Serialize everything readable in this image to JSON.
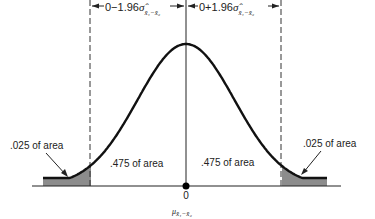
{
  "diagram": {
    "type": "normal-distribution-two-tailed",
    "top_labels": {
      "left": {
        "prefix": "0−1.96",
        "sigma": "σ̂",
        "subscript": "x̄₁−x̄₂"
      },
      "right": {
        "prefix": "0+1.96",
        "sigma": "σ̂",
        "subscript": "x̄₁−x̄₂"
      }
    },
    "regions": [
      {
        "name": "left-tail",
        "label": ".025 of area",
        "shaded": true,
        "area": 0.025
      },
      {
        "name": "left-center",
        "label": ".475 of area",
        "shaded": false,
        "area": 0.475
      },
      {
        "name": "right-center",
        "label": ".475 of area",
        "shaded": false,
        "area": 0.475
      },
      {
        "name": "right-tail",
        "label": ".025 of area",
        "shaded": true,
        "area": 0.025
      }
    ],
    "center_value": "0",
    "center_symbol": "μ",
    "center_subscript": "x̄₁−x̄₂",
    "critical_z": 1.96,
    "colors": {
      "curve": "#111111",
      "shade": "#8c8c8c",
      "axis": "#222222"
    }
  }
}
